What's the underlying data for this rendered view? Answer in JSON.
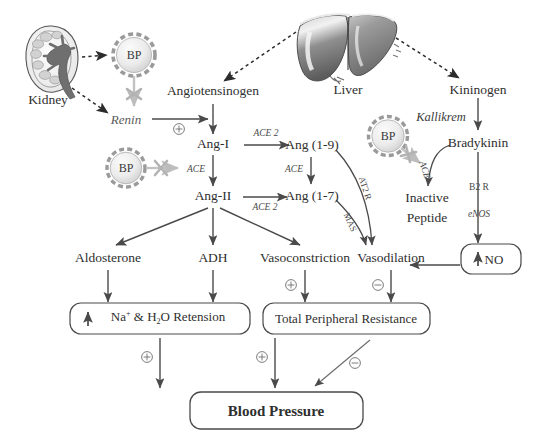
{
  "figure": {
    "colors": {
      "line": "#4a4a4a",
      "inhibit": "#b9b9b9",
      "organ_dark": "#6e6e6e",
      "organ_light": "#d8d8d8",
      "text": "#2f2f2f"
    }
  },
  "organs": {
    "kidney": {
      "label": "Kidney"
    },
    "liver": {
      "label": "Liver"
    }
  },
  "bp_nodes": [
    {
      "label": "BP",
      "id": "bp-renin"
    },
    {
      "label": "BP",
      "id": "bp-ace"
    },
    {
      "label": "BP",
      "id": "bp-bradykinin"
    }
  ],
  "nodes": {
    "angiotensinogen": "Angiotensinogen",
    "renin": "Renin",
    "ang1": "Ang-I",
    "ang2": "Ang-II",
    "ang19": "Ang (1-9)",
    "ang17": "Ang (1-7)",
    "kininogen": "Kininogen",
    "bradykinin": "Bradykinin",
    "inactive_peptide_l1": "Inactive",
    "inactive_peptide_l2": "Peptide",
    "aldosterone": "Aldosterone",
    "adh": "ADH",
    "vasoconstriction": "Vasoconstriction",
    "vasodilation": "Vasodilation"
  },
  "enzymes": {
    "ace2_a": "ACE 2",
    "ace2_b": "ACE 2",
    "ace_vertical_left": "ACE",
    "ace_vertical_right": "ACE",
    "ace_curved": "ACE",
    "kallikrein": "Kallikrem",
    "b2r": "B2 R",
    "enos": "eNOS",
    "at2r": "AT2 R",
    "mas": "MAS"
  },
  "boxes": {
    "no": {
      "arrow": "↑",
      "label": "NO"
    },
    "retention": {
      "arrow": "↑",
      "text_pre": "Na",
      "sup": "+",
      "text_mid": " & H",
      "sub": "2",
      "text_post": "O Retension"
    },
    "tpr": {
      "label": "Total Peripheral Resistance"
    },
    "blood_pressure": {
      "label": "Blood Pressure"
    }
  },
  "signs": {
    "plus_renin": "⊕",
    "plus_vasoconstriction": "⊕",
    "minus_vasodilation": "⊖",
    "plus_retention": "⊕",
    "plus_tpr": "⊕",
    "minus_tpr": "⊖"
  }
}
